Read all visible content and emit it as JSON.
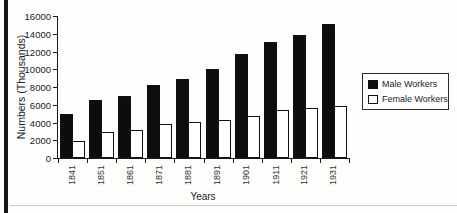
{
  "page": {
    "background": "#fdfdfc",
    "left_border_color": "#141414",
    "divider_color": "#c9c9c9"
  },
  "chart_data": {
    "type": "bar",
    "title": "",
    "xlabel": "Years",
    "ylabel": "Numbers (Thousands)",
    "categories": [
      "1841",
      "1851",
      "1861",
      "1871",
      "1881",
      "1891",
      "1901",
      "1911",
      "1921",
      "1931"
    ],
    "series": [
      {
        "name": "Male Workers",
        "color": "#0d0d0d",
        "values": [
          5000,
          6500,
          7000,
          8200,
          8900,
          10000,
          11700,
          13100,
          13900,
          15100
        ]
      },
      {
        "name": "Female Workers",
        "color": "#ffffff",
        "values": [
          1900,
          2900,
          3200,
          3800,
          4000,
          4300,
          4700,
          5400,
          5600,
          5900
        ]
      }
    ],
    "ylim": [
      0,
      16000
    ],
    "y_ticks": [
      0,
      2000,
      4000,
      6000,
      8000,
      10000,
      12000,
      14000,
      16000
    ],
    "grid": false,
    "legend_position": "right",
    "axis_color": "#1a1a1a",
    "bar_border_color": "#111111"
  }
}
